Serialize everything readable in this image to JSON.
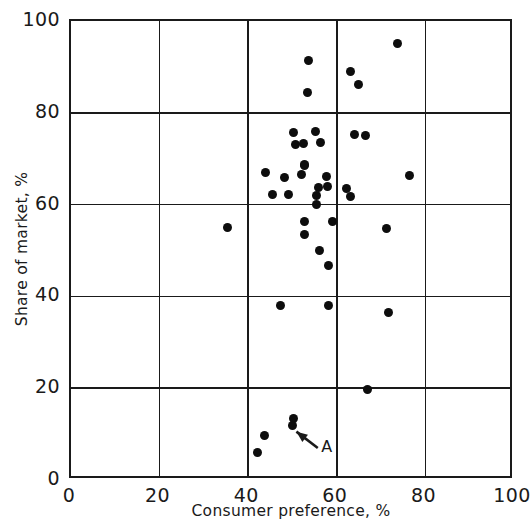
{
  "chart_data": {
    "type": "scatter",
    "title": "",
    "xlabel": "Consumer preference, %",
    "ylabel": "Share of market, %",
    "xlim": [
      0,
      100
    ],
    "ylim": [
      0,
      100
    ],
    "xticks": [
      0,
      20,
      40,
      60,
      80,
      100
    ],
    "yticks": [
      0,
      20,
      40,
      60,
      80,
      100
    ],
    "xtick_labels": [
      "0",
      "20",
      "40",
      "60",
      "80",
      "100"
    ],
    "ytick_labels": [
      "0",
      "20",
      "40",
      "60",
      "80",
      "100"
    ],
    "grid": true,
    "legend": false,
    "marker": "filled-circle",
    "marker_color": "#0d0d0d",
    "axis_color": "#1a1a1a",
    "points": [
      {
        "x": 53.7,
        "y": 91.3
      },
      {
        "x": 53.3,
        "y": 84.5
      },
      {
        "x": 63.2,
        "y": 89.1
      },
      {
        "x": 65.0,
        "y": 86.1
      },
      {
        "x": 73.8,
        "y": 95.0
      },
      {
        "x": 50.3,
        "y": 75.6
      },
      {
        "x": 55.1,
        "y": 76.0
      },
      {
        "x": 50.6,
        "y": 73.2
      },
      {
        "x": 52.4,
        "y": 73.4
      },
      {
        "x": 56.4,
        "y": 73.6
      },
      {
        "x": 52.8,
        "y": 68.8
      },
      {
        "x": 63.9,
        "y": 75.2
      },
      {
        "x": 66.4,
        "y": 75.0
      },
      {
        "x": 43.8,
        "y": 66.9
      },
      {
        "x": 52.6,
        "y": 68.6
      },
      {
        "x": 48.1,
        "y": 65.8
      },
      {
        "x": 52.1,
        "y": 66.5
      },
      {
        "x": 57.6,
        "y": 66.2
      },
      {
        "x": 55.8,
        "y": 63.8
      },
      {
        "x": 57.8,
        "y": 64.0
      },
      {
        "x": 45.4,
        "y": 62.1
      },
      {
        "x": 49.2,
        "y": 62.1
      },
      {
        "x": 55.5,
        "y": 61.9
      },
      {
        "x": 62.3,
        "y": 63.4
      },
      {
        "x": 63.2,
        "y": 61.7
      },
      {
        "x": 76.5,
        "y": 66.4
      },
      {
        "x": 55.5,
        "y": 60.1
      },
      {
        "x": 35.4,
        "y": 55.1
      },
      {
        "x": 52.8,
        "y": 56.4
      },
      {
        "x": 59.1,
        "y": 56.4
      },
      {
        "x": 52.8,
        "y": 53.4
      },
      {
        "x": 56.0,
        "y": 49.9
      },
      {
        "x": 58.2,
        "y": 46.8
      },
      {
        "x": 71.3,
        "y": 54.9
      },
      {
        "x": 47.4,
        "y": 38.1
      },
      {
        "x": 58.2,
        "y": 38.1
      },
      {
        "x": 71.6,
        "y": 36.4
      },
      {
        "x": 67.0,
        "y": 19.8
      },
      {
        "x": 50.3,
        "y": 13.5
      },
      {
        "x": 49.9,
        "y": 11.8
      },
      {
        "x": 43.6,
        "y": 9.8
      },
      {
        "x": 42.0,
        "y": 6.1
      }
    ],
    "annotations": [
      {
        "label": "A",
        "target": {
          "x": 50.8,
          "y": 10.5
        },
        "label_pos": {
          "x": 55.8,
          "y": 6.8
        },
        "type": "arrow"
      }
    ]
  }
}
